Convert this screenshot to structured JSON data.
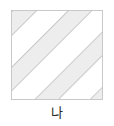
{
  "figure": {
    "caption": "나",
    "shape_name": "square",
    "background_color": "#ffffff"
  },
  "square": {
    "border_color": "#c9c9c9",
    "fill_color": "#ffffff",
    "x": 11,
    "y": 10,
    "width": 92,
    "height": 90
  },
  "stripes": {
    "fill_color": "#ededed",
    "edge_color": "#c8c8c8",
    "angle_degrees": -45,
    "direction": "top-left-to-bottom-right",
    "band_width": 18,
    "band_gap": 22,
    "count": 4,
    "offsets": [
      -74,
      -34,
      6,
      46,
      86
    ]
  }
}
